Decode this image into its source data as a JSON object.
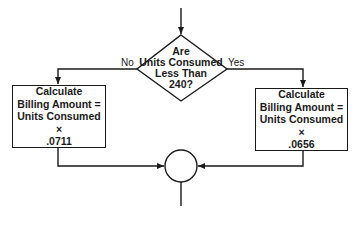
{
  "diagram": {
    "type": "flowchart",
    "decision": {
      "lines": [
        "Are",
        "Units Consumed",
        "Less Than",
        "240?"
      ]
    },
    "branches": {
      "no_label": "No",
      "yes_label": "Yes"
    },
    "left_process": {
      "lines": [
        "Calculate",
        "Billing Amount =",
        "Units Consumed ×",
        ".0711"
      ]
    },
    "right_process": {
      "lines": [
        "Calculate",
        "Billing Amount =",
        "Units Consumed ×",
        ".0656"
      ]
    },
    "connector": {
      "shape": "circle"
    },
    "colors": {
      "stroke": "#1a1a1a",
      "background": "#ffffff"
    }
  }
}
